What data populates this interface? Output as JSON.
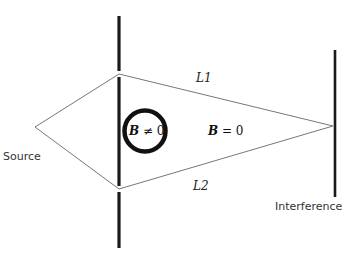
{
  "diagram": {
    "labels": {
      "source": "Source",
      "interference": "Interference",
      "path1": "L1",
      "path2": "L2",
      "field_inside_symbol": "B",
      "field_inside_rel": "≠ 0",
      "field_outside_symbol": "B",
      "field_outside_rel": "= 0"
    },
    "colors": {
      "barrier": "#1a1a1a",
      "paths": "#777777",
      "solenoid": "#111111",
      "background": "#ffffff"
    },
    "geometry": {
      "source_point": [
        35,
        127
      ],
      "slit_top": [
        119,
        74
      ],
      "slit_bottom": [
        119,
        189
      ],
      "screen_point": [
        333,
        126
      ],
      "barrier_x": 119,
      "barrier_segments": [
        [
          16,
          71
        ],
        [
          77,
          186
        ],
        [
          192,
          248
        ]
      ],
      "screen_x": 335,
      "screen_span": [
        50,
        197
      ],
      "solenoid_center": [
        145,
        131
      ],
      "solenoid_radius": 21
    }
  }
}
